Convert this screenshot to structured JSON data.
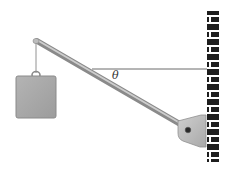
{
  "diagram": {
    "type": "physics-statics",
    "labels": {
      "angle": "θ"
    },
    "components": [
      {
        "name": "weight-block",
        "label": ""
      },
      {
        "name": "hanging-string",
        "label": ""
      },
      {
        "name": "rod",
        "label": ""
      },
      {
        "name": "horizontal-cable",
        "label": ""
      },
      {
        "name": "hinge-bracket",
        "label": ""
      },
      {
        "name": "brick-wall",
        "label": ""
      }
    ],
    "colors": {
      "background": "#ffffff",
      "block_fill": "#a8a8a8",
      "block_stroke": "#8a8a8a",
      "rod_fill": "#9e9e9e",
      "rod_highlight": "#d6d6d6",
      "bracket_fill": "#bdbdbd",
      "brick_dark": "#1e1e1e",
      "cable": "#6a6a6a"
    }
  }
}
